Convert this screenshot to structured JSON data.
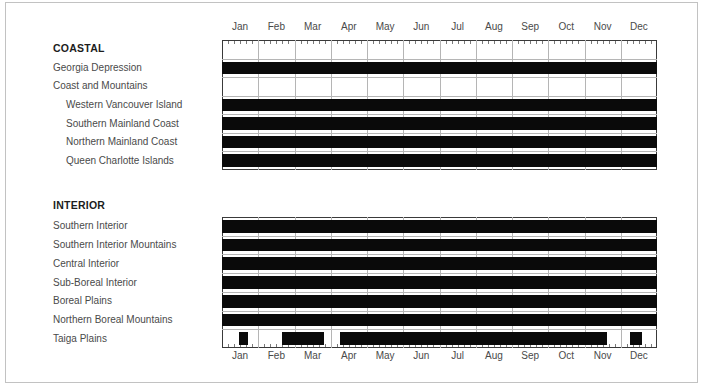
{
  "figure": {
    "background": "#ffffff",
    "frame_border_color": "#c2c2c2",
    "box_border_color": "#3a3a3a",
    "grid_color": "#b5b5b5",
    "tick_color": "#7a7a7a",
    "bar_color": "#0a0a0a",
    "label_color": "#4a4a4a",
    "heading_color": "#1c1c1c"
  },
  "chart_data": {
    "type": "bar",
    "subtype": "horizontal-seasonal-span",
    "orientation": "horizontal",
    "x": {
      "unit": "month",
      "range": [
        0,
        12
      ],
      "tick_labels": [
        "Jan",
        "Feb",
        "Mar",
        "Apr",
        "May",
        "Jun",
        "Jul",
        "Aug",
        "Sep",
        "Oct",
        "Nov",
        "Dec"
      ],
      "minor_ticks_per_month": 6,
      "grid": true
    },
    "charts": [
      {
        "name": "COASTAL",
        "axis_position": "top",
        "rows": [
          {
            "label": "COASTAL",
            "bold": true,
            "indent": 0,
            "spans": []
          },
          {
            "label": "Georgia Depression",
            "bold": false,
            "indent": 0,
            "spans": [
              [
                0,
                12
              ]
            ]
          },
          {
            "label": "Coast and Mountains",
            "bold": false,
            "indent": 0,
            "spans": []
          },
          {
            "label": "Western Vancouver Island",
            "bold": false,
            "indent": 1,
            "spans": [
              [
                0,
                12
              ]
            ]
          },
          {
            "label": "Southern Mainland Coast",
            "bold": false,
            "indent": 1,
            "spans": [
              [
                0,
                12
              ]
            ]
          },
          {
            "label": "Northern Mainland Coast",
            "bold": false,
            "indent": 1,
            "spans": [
              [
                0,
                12
              ]
            ]
          },
          {
            "label": "Queen Charlotte Islands",
            "bold": false,
            "indent": 1,
            "spans": [
              [
                0,
                12
              ]
            ]
          }
        ]
      },
      {
        "name": "INTERIOR",
        "axis_position": "bottom",
        "rows": [
          {
            "label": "Southern Interior",
            "bold": false,
            "indent": 0,
            "spans": [
              [
                0,
                12
              ]
            ]
          },
          {
            "label": "Southern Interior Mountains",
            "bold": false,
            "indent": 0,
            "spans": [
              [
                0,
                12
              ]
            ]
          },
          {
            "label": "Central Interior",
            "bold": false,
            "indent": 0,
            "spans": [
              [
                0,
                12
              ]
            ]
          },
          {
            "label": "Sub-Boreal Interior",
            "bold": false,
            "indent": 0,
            "spans": [
              [
                0,
                12
              ]
            ]
          },
          {
            "label": "Boreal Plains",
            "bold": false,
            "indent": 0,
            "spans": [
              [
                0,
                12
              ]
            ]
          },
          {
            "label": "Northern Boreal Mountains",
            "bold": false,
            "indent": 0,
            "spans": [
              [
                0,
                12
              ]
            ]
          },
          {
            "label": "Taiga Plains",
            "bold": false,
            "indent": 0,
            "spans": [
              [
                0.46,
                0.73
              ],
              [
                1.65,
                2.8
              ],
              [
                3.26,
                10.61
              ],
              [
                11.26,
                11.58
              ]
            ]
          }
        ]
      }
    ]
  }
}
